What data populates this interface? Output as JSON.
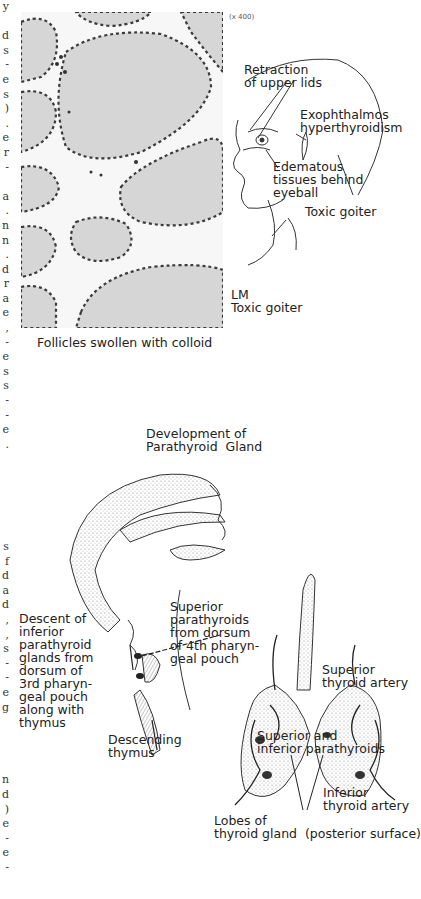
{
  "margin_fragments": [
    "y",
    "",
    "d",
    "s",
    "-",
    "e",
    "s",
    ")",
    ".",
    "e",
    "r",
    "-",
    "",
    "a",
    ".",
    "n",
    "n",
    ".",
    "d",
    "r",
    "a",
    "e",
    ",",
    "-",
    "e",
    "s",
    "s",
    "-",
    "-",
    "e",
    ".",
    "",
    "",
    "",
    "",
    "",
    "",
    "s",
    "f",
    "d",
    "a",
    "d",
    ",",
    ",",
    "s",
    "-",
    "-",
    "e",
    "g",
    "",
    "",
    "",
    "",
    "n",
    "d",
    ")",
    "e",
    "-",
    "e",
    "-"
  ],
  "micrograph": {
    "magnification": "(x 400)",
    "caption": "Follicles swollen with colloid",
    "stain_label_line1": "LM",
    "stain_label_line2": "Toxic goiter"
  },
  "face_figure": {
    "labels": {
      "retraction": "Retraction\nof upper lids",
      "exophthalmos": "Exophthalmos\nhyperthyroidism",
      "edematous": "Edematous\ntissues behind\neyeball",
      "goiter": "Toxic goiter"
    }
  },
  "development_figure": {
    "title_line1": "Development of",
    "title_line2": "Parathyroid  Gland",
    "labels": {
      "descent": "Descent of\ninferior\nparathyroid\nglands from\ndorsum of\n3rd pharyn-\ngeal pouch\nalong with\nthymus",
      "superior": "Superior\nparathyroids\nfrom dorsum\nof 4th pharyn-\ngeal pouch",
      "thymus": "Descending\nthymus"
    }
  },
  "thyroid_figure": {
    "labels": {
      "sup_artery": "Superior\nthyroid artery",
      "parathyroids": "Superior and\ninferior parathyroids",
      "inf_artery": "Inferior\nthyroid artery",
      "lobes": "Lobes of\nthyroid gland  (posterior surface)"
    }
  },
  "colors": {
    "ink": "#222222",
    "colloid": "#d9d9d9",
    "nuclei": "#3a3a3a",
    "stipple": "#9a9a9a"
  }
}
